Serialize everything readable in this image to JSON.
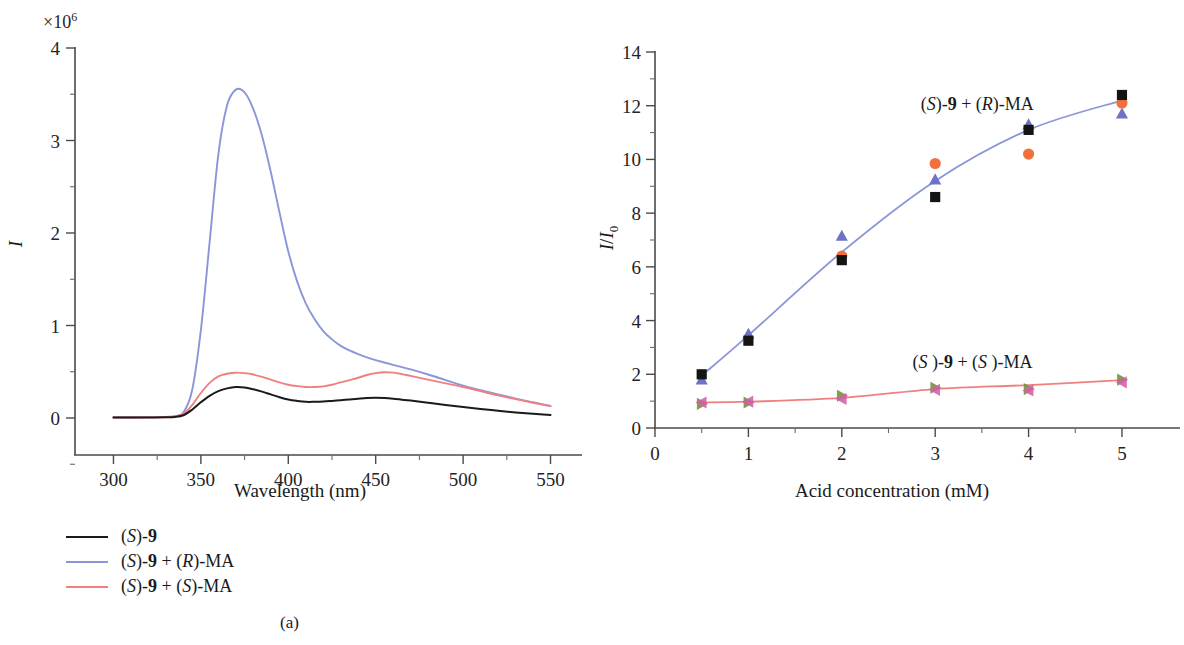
{
  "figure": {
    "panel_a_caption": "(a)",
    "panel_b_caption": "(b)"
  },
  "legend": {
    "items": [
      {
        "label_html": "(S)-9",
        "color": "#1a1a1a",
        "name": "legend-s9"
      },
      {
        "label_html": "(S)-9 + (R)-MA",
        "color": "#8a96d8",
        "name": "legend-s9-r-ma"
      },
      {
        "label_html": "(S)-9 + (S)-MA",
        "color": "#f08080",
        "name": "legend-s9-s-ma"
      }
    ]
  },
  "panel_a": {
    "multiplier": "×10",
    "multiplier_exp": "6",
    "ylabel": "I",
    "xlabel": "Wavelength (nm)",
    "xticks": [
      "300",
      "350",
      "400",
      "450",
      "500",
      "550"
    ],
    "yticks": [
      "0",
      "1",
      "2",
      "3",
      "4"
    ]
  },
  "panel_b": {
    "ylabel": "I/I",
    "ylabel_sub": "0",
    "xlabel": "Acid concentration (mM)",
    "xticks": [
      "0",
      "1",
      "2",
      "3",
      "4",
      "5"
    ],
    "yticks": [
      "0",
      "2",
      "4",
      "6",
      "8",
      "10",
      "12",
      "14"
    ],
    "annotation_upper": "(S)-9 + (R)-MA",
    "annotation_lower": "(S)-9 + (S )-MA"
  },
  "chart_data": [
    {
      "type": "line",
      "panel": "a",
      "title": "Fluorescence emission spectra",
      "xlabel": "Wavelength (nm)",
      "ylabel": "I",
      "y_multiplier": 1000000,
      "y_multiplier_label": "×10^6",
      "xlim": [
        278,
        560
      ],
      "ylim": [
        -0.55,
        4.0
      ],
      "xticks": [
        300,
        350,
        400,
        450,
        500,
        550
      ],
      "yticks": [
        0,
        1,
        2,
        3,
        4
      ],
      "grid": false,
      "legend_position": "below-left",
      "series": [
        {
          "name": "(S)-9",
          "color": "#1a1a1a",
          "x": [
            300,
            310,
            320,
            330,
            335,
            340,
            345,
            350,
            355,
            360,
            365,
            370,
            375,
            380,
            385,
            390,
            395,
            400,
            405,
            410,
            415,
            420,
            425,
            430,
            435,
            440,
            445,
            450,
            455,
            460,
            465,
            470,
            480,
            490,
            500,
            510,
            520,
            530,
            540,
            550
          ],
          "values": [
            0.005,
            0.005,
            0.006,
            0.008,
            0.012,
            0.03,
            0.09,
            0.17,
            0.24,
            0.29,
            0.32,
            0.335,
            0.33,
            0.31,
            0.285,
            0.255,
            0.225,
            0.2,
            0.185,
            0.175,
            0.175,
            0.178,
            0.185,
            0.193,
            0.2,
            0.208,
            0.215,
            0.218,
            0.215,
            0.208,
            0.198,
            0.188,
            0.165,
            0.14,
            0.118,
            0.098,
            0.078,
            0.06,
            0.045,
            0.032
          ]
        },
        {
          "name": "(S)-9 + (R)-MA",
          "color": "#8a96d8",
          "x": [
            300,
            310,
            320,
            330,
            335,
            340,
            345,
            350,
            355,
            360,
            365,
            370,
            375,
            380,
            385,
            390,
            395,
            400,
            405,
            410,
            415,
            420,
            425,
            430,
            435,
            440,
            445,
            450,
            455,
            460,
            465,
            470,
            480,
            490,
            500,
            510,
            520,
            530,
            540,
            550
          ],
          "values": [
            0.008,
            0.008,
            0.009,
            0.012,
            0.02,
            0.06,
            0.3,
            0.95,
            1.9,
            2.85,
            3.38,
            3.55,
            3.52,
            3.34,
            3.05,
            2.66,
            2.22,
            1.8,
            1.48,
            1.24,
            1.07,
            0.94,
            0.85,
            0.78,
            0.73,
            0.69,
            0.655,
            0.625,
            0.6,
            0.575,
            0.55,
            0.525,
            0.47,
            0.41,
            0.35,
            0.3,
            0.255,
            0.21,
            0.17,
            0.13
          ]
        },
        {
          "name": "(S)-9 + (S)-MA",
          "color": "#f08080",
          "x": [
            300,
            310,
            320,
            330,
            335,
            340,
            345,
            350,
            355,
            360,
            365,
            370,
            375,
            380,
            385,
            390,
            395,
            400,
            405,
            410,
            415,
            420,
            425,
            430,
            435,
            440,
            445,
            450,
            455,
            460,
            465,
            470,
            480,
            490,
            500,
            510,
            520,
            530,
            540,
            550
          ],
          "values": [
            0.006,
            0.006,
            0.007,
            0.01,
            0.016,
            0.045,
            0.14,
            0.27,
            0.38,
            0.45,
            0.478,
            0.49,
            0.485,
            0.47,
            0.445,
            0.415,
            0.385,
            0.36,
            0.345,
            0.335,
            0.335,
            0.342,
            0.36,
            0.385,
            0.41,
            0.435,
            0.465,
            0.485,
            0.495,
            0.49,
            0.475,
            0.455,
            0.415,
            0.375,
            0.335,
            0.29,
            0.245,
            0.205,
            0.165,
            0.128
          ]
        }
      ]
    },
    {
      "type": "scatter",
      "panel": "b",
      "title": "Fluorescence enhancement vs acid concentration",
      "xlabel": "Acid concentration (mM)",
      "ylabel": "I/I0",
      "xlim": [
        0,
        5.45
      ],
      "ylim": [
        0,
        14
      ],
      "xticks": [
        0,
        1,
        2,
        3,
        4,
        5
      ],
      "yticks": [
        0,
        2,
        4,
        6,
        8,
        10,
        12,
        14
      ],
      "grid": false,
      "annotations": [
        {
          "text": "(S)-9 + (R)-MA",
          "x": 3.45,
          "y": 11.85
        },
        {
          "text": "(S )-9 + (S )-MA",
          "x": 3.4,
          "y": 2.25
        }
      ],
      "x": [
        0.5,
        1,
        2,
        3,
        4,
        5
      ],
      "series": [
        {
          "name": "(S)-9 + (R)-MA run 1",
          "marker": "square",
          "color": "#141414",
          "values": [
            2.0,
            3.25,
            6.25,
            8.6,
            11.1,
            12.4
          ]
        },
        {
          "name": "(S)-9 + (R)-MA run 2",
          "marker": "circle",
          "color": "#f2703c",
          "values": [
            0.95,
            1.0,
            6.4,
            9.85,
            10.2,
            12.1
          ]
        },
        {
          "name": "(S)-9 + (R)-MA run 3",
          "marker": "triangle-up",
          "color": "#6f72c9",
          "values": [
            1.8,
            3.5,
            7.15,
            9.25,
            11.3,
            11.7
          ]
        },
        {
          "name": "(S)-9 + (S)-MA run 1",
          "marker": "triangle-right",
          "color": "#6f9134",
          "values": [
            0.9,
            0.95,
            1.2,
            1.5,
            1.45,
            1.8
          ]
        },
        {
          "name": "(S)-9 + (S)-MA run 2",
          "marker": "triangle-left",
          "color": "#d45fa8",
          "values": [
            0.95,
            0.98,
            1.08,
            1.42,
            1.4,
            1.7
          ]
        }
      ],
      "fit_curves": [
        {
          "name": "(S)-9 + (R)-MA fit",
          "color": "#8a96d8",
          "x": [
            0.5,
            1,
            2,
            3,
            4,
            5
          ],
          "values": [
            1.95,
            3.45,
            6.55,
            9.2,
            11.1,
            12.2
          ]
        },
        {
          "name": "(S)-9 + (S)-MA fit",
          "color": "#f08080",
          "x": [
            0.5,
            1,
            2,
            3,
            4,
            5
          ],
          "values": [
            0.95,
            0.98,
            1.12,
            1.45,
            1.6,
            1.78
          ]
        }
      ]
    }
  ]
}
